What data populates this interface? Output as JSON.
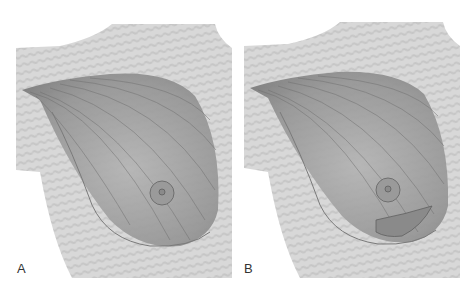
{
  "figure": {
    "panels": [
      {
        "id": "A",
        "label": "A"
      },
      {
        "id": "B",
        "label": "B"
      }
    ],
    "colors": {
      "background": "#ffffff",
      "skin": "#d6d6d6",
      "skin_stripe": "#c4c4c4",
      "breast_tissue": "#9a9a9a",
      "breast_shadow": "#7a7a7a",
      "outline": "#888888",
      "nipple": "#8c8c8c"
    }
  }
}
